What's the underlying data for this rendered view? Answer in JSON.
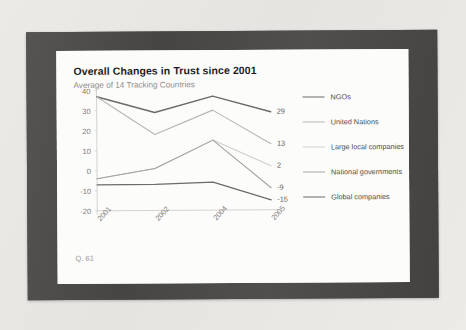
{
  "slide": {
    "title": "Overall Changes in Trust since 2001",
    "subtitle": "Average of 14 Tracking Countries",
    "question_note": "Q. 61"
  },
  "chart_data": {
    "type": "line",
    "title": "Overall Changes in Trust since 2001",
    "subtitle": "Average of 14 Tracking Countries",
    "xlabel": "",
    "ylabel": "",
    "categories": [
      "2001",
      "2002",
      "2004",
      "2005"
    ],
    "ylim": [
      -20,
      40
    ],
    "yticks": [
      40,
      30,
      20,
      10,
      0,
      -10,
      -20
    ],
    "grid": false,
    "legend_position": "right",
    "series": [
      {
        "name": "NGOs",
        "values": [
          37,
          29,
          37,
          29
        ],
        "end_label": "29",
        "color": "#6d6b69",
        "width": 1.5
      },
      {
        "name": "United Nations",
        "values": [
          37,
          18,
          30,
          13
        ],
        "end_label": "13",
        "color": "#b8b6b4",
        "width": 1.1
      },
      {
        "name": "Large local companies",
        "values": [
          -4,
          1,
          15,
          2
        ],
        "end_label": "2",
        "color": "#cfcdcb",
        "width": 1.1
      },
      {
        "name": "National governments",
        "values": [
          -4,
          1,
          15,
          -9
        ],
        "end_label": "-9",
        "color": "#a5a3a1",
        "width": 1.1
      },
      {
        "name": "Global companies",
        "values": [
          -7,
          -7,
          -6,
          -15
        ],
        "end_label": "-15",
        "color": "#6d6b69",
        "width": 1.3
      }
    ]
  },
  "legend": {
    "items": [
      {
        "label": "NGOs",
        "color": "#6d6b69",
        "width": "1.6px"
      },
      {
        "label": "United Nations",
        "color": "#bab8b6",
        "width": "1.1px"
      },
      {
        "label": "Large local companies",
        "color": "#d2d0ce",
        "width": "1.1px"
      },
      {
        "label": "National governments",
        "color": "#a7a5a3",
        "width": "1.1px"
      },
      {
        "label": "Global companies",
        "color": "#6a6866",
        "width": "1.5px"
      }
    ]
  }
}
